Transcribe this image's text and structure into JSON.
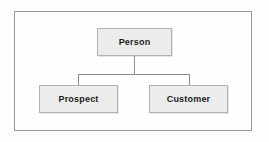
{
  "diagram": {
    "frame": {
      "name": "diagram-border"
    },
    "colors": {
      "node_fill": "#ececec",
      "node_border": "#b2b2b2",
      "connector": "#8e8e8e",
      "frame_border": "#9a9a9a",
      "label_text": "#1c1c1c",
      "background": "#ffffff"
    },
    "nodes": [
      {
        "id": "person",
        "label": "Person",
        "role": "parent"
      },
      {
        "id": "prospect",
        "label": "Prospect",
        "role": "child"
      },
      {
        "id": "customer",
        "label": "Customer",
        "role": "child"
      }
    ],
    "connectors": [
      {
        "id": "trunk",
        "from": "person",
        "to": "junction"
      },
      {
        "id": "bar",
        "from": "junction",
        "to": "junction"
      },
      {
        "id": "drop-left",
        "from": "junction",
        "to": "prospect"
      },
      {
        "id": "drop-right",
        "from": "junction",
        "to": "customer"
      }
    ]
  }
}
